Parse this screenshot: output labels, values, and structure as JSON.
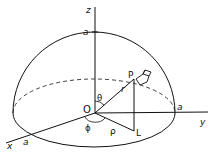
{
  "figure": {
    "labels": {
      "z_axis": "z",
      "y_axis": "y",
      "x_axis": "x",
      "a_top": "a",
      "a_right": "a",
      "a_front": "a",
      "origin": "O",
      "point_p": "P",
      "point_l": "L",
      "radius_r": "r",
      "rho": "ρ",
      "theta": "θ",
      "phi": "ϕ"
    },
    "colors": {
      "stroke": "#111111",
      "background": "#ffffff"
    }
  }
}
